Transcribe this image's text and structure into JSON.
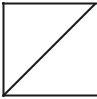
{
  "diagram": {
    "shape": "square-with-diagonal",
    "stroke_color": "#1a1a1a",
    "background_color": "#ffffff",
    "stroke_width": 2,
    "edges": {
      "top": {
        "x1": 3,
        "y1": 3.5,
        "x2": 97,
        "y2": 3.5
      },
      "left": {
        "x1": 3.5,
        "y1": 3,
        "x2": 3.5,
        "y2": 96
      },
      "bottom": {
        "x1": 3,
        "y1": 95.5,
        "x2": 97,
        "y2": 95.5
      },
      "diagonal": {
        "x1": 4,
        "y1": 95,
        "x2": 95,
        "y2": 4
      }
    }
  }
}
